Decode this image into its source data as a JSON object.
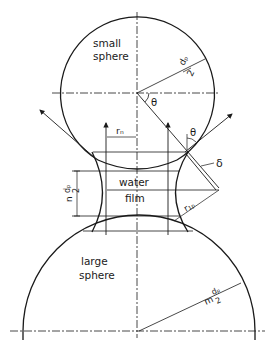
{
  "labels": {
    "small_sphere": [
      "small",
      "sphere"
    ],
    "large_sphere": [
      "large",
      "sphere"
    ],
    "water_film": [
      "water",
      "film"
    ],
    "theta_top": "θ",
    "theta_right": "θ",
    "delta": "δ",
    "r_n": "rₙ",
    "r_1p": "r₁ₚ",
    "small_radius_num": "dₚ",
    "small_radius_den": "2",
    "large_radius_prefix": "m",
    "large_radius_num": "dₚ",
    "large_radius_den": "2",
    "gap_prefix": "n",
    "gap_num": "dₚ",
    "gap_den": "2"
  },
  "geometry": {
    "small_sphere": {
      "cx": 137,
      "cy": 93,
      "r": 77
    },
    "large_sphere": {
      "cx": 139,
      "cy": 331,
      "r": 116
    },
    "centerline_x": 137
  },
  "colors": {
    "ink": "#1a1a1a",
    "background": "#ffffff"
  }
}
